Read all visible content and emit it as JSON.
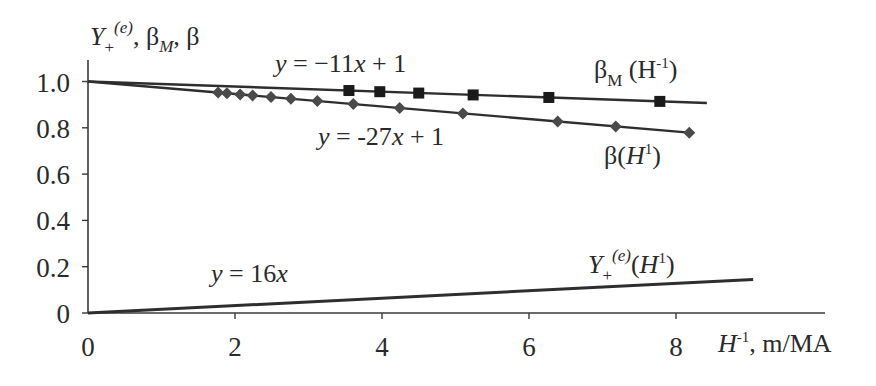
{
  "chart_data": {
    "type": "line",
    "title": "",
    "xlabel": "H⁻¹, m/MA",
    "ylabel": "Y₊⁽ᵉ⁾, βM, β",
    "xlim": [
      0,
      10.2
    ],
    "ylim": [
      0,
      1.1
    ],
    "x_ticks": [
      0,
      2,
      4,
      6,
      8
    ],
    "x_tick_labels": [
      "0",
      "2",
      "4",
      "6",
      "8"
    ],
    "y_ticks": [
      0,
      0.2,
      0.4,
      0.6,
      0.8,
      1.0
    ],
    "y_tick_labels": [
      "0",
      "0.2",
      "0.4",
      "0.6",
      "0.8",
      "1.0"
    ],
    "grid": false,
    "legend": null,
    "series": [
      {
        "name": "βM (H⁻¹)",
        "marker": "square",
        "x": [
          3.55,
          3.97,
          4.5,
          5.24,
          6.27,
          7.78
        ],
        "y": [
          0.961,
          0.956,
          0.95,
          0.942,
          0.931,
          0.914
        ],
        "fit": {
          "equation": "y = −11x + 1",
          "slope": -0.011,
          "intercept": 1,
          "x_range": [
            0,
            8.42
          ]
        }
      },
      {
        "name": "β(H⁻¹)",
        "marker": "diamond",
        "x": [
          1.77,
          1.89,
          2.07,
          2.24,
          2.49,
          2.76,
          3.12,
          3.61,
          4.24,
          5.1,
          6.39,
          7.18,
          8.18
        ],
        "y": [
          0.952,
          0.949,
          0.944,
          0.94,
          0.933,
          0.925,
          0.916,
          0.903,
          0.886,
          0.862,
          0.827,
          0.806,
          0.779
        ],
        "fit": {
          "equation": "y = -27x + 1",
          "slope": -0.027,
          "intercept": 1,
          "x_range": [
            0,
            8.18
          ]
        }
      },
      {
        "name": "Y₊⁽ᵉ⁾(H⁻¹)",
        "marker": "none",
        "x": [
          0,
          9.05
        ],
        "y": [
          0,
          0.145
        ],
        "fit": {
          "equation": "y = 16x",
          "slope": 0.016,
          "intercept": 0,
          "x_range": [
            0,
            9.05
          ]
        }
      }
    ],
    "annotations": [
      {
        "text": "y = −11x + 1",
        "x": 2.6,
        "y": 1.03
      },
      {
        "text": "y = -27x + 1",
        "x": 3.1,
        "y": 0.76
      },
      {
        "text": "y = 16x",
        "x": 1.7,
        "y": 0.2
      },
      {
        "text": "βM (H⁻¹)",
        "x": 6.7,
        "y": 1.0
      },
      {
        "text": "β(H⁻¹)",
        "x": 6.8,
        "y": 0.72
      },
      {
        "text": "Y₊⁽ᵉ⁾(H⁻¹)",
        "x": 6.5,
        "y": 0.17
      }
    ]
  },
  "labels": {
    "y_axis": {
      "main": "Y",
      "sub": "+",
      "sup": "(e)",
      "rest1": ", β",
      "sub2": "M",
      "rest2": ", β"
    },
    "x_axis": {
      "main": "H",
      "sup": "-1",
      "rest": ", m/MA"
    },
    "eq_betaM": {
      "y": "y",
      "rest": " = −11",
      "x": "x",
      "tail": " + 1"
    },
    "eq_beta": {
      "y": "y",
      "rest": " = -27",
      "x": "x",
      "tail": " + 1"
    },
    "eq_Y": {
      "y": "y",
      "rest": " = 16",
      "x": "x"
    },
    "name_betaM": {
      "b": "β",
      "sub": "M",
      "rest": " (H",
      "sup": "-1",
      "close": ")"
    },
    "name_beta": {
      "b": "β(",
      "h": "H",
      "sup": "1",
      "close": ")"
    },
    "name_Y": {
      "main": "Y",
      "sub": "+",
      "sup": "(e)",
      "open": "(",
      "h": "H",
      "sup2": "1",
      "close": ")"
    }
  },
  "colors": {
    "line": "#2e2e2e",
    "axis": "#3a3a3a",
    "marker_square": "#1a1a1a",
    "marker_diamond": "#4a4a4a"
  }
}
